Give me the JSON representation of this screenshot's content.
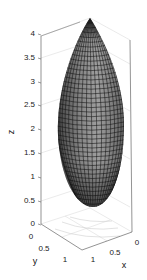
{
  "chart_data": {
    "type": "surface3d",
    "title": "",
    "xlabel": "x",
    "ylabel": "y",
    "zlabel": "z",
    "xlim": [
      0,
      1
    ],
    "ylim": [
      0,
      1
    ],
    "zlim": [
      0,
      4
    ],
    "x_ticks": [
      "0",
      "0.5",
      "1"
    ],
    "y_ticks": [
      "0",
      "0.5",
      "1"
    ],
    "z_ticks": [
      "0",
      "0.5",
      "1",
      "1.5",
      "2",
      "2.5",
      "3",
      "3.5",
      "4"
    ],
    "surface": {
      "apex_z": 4,
      "bottom_z": 0.5,
      "max_radius": 0.5,
      "center": [
        0.5,
        0.5
      ],
      "colormap": "gray",
      "mesh": true
    },
    "box": true,
    "grid": true
  },
  "axes": {
    "xlabel": "x",
    "ylabel": "y",
    "zlabel": "z",
    "x_ticks": [
      "0",
      "0.5",
      "1"
    ],
    "y_ticks": [
      "0",
      "0.5",
      "1"
    ],
    "z_ticks": [
      "0",
      "0.5",
      "1",
      "1.5",
      "2",
      "2.5",
      "3",
      "3.5",
      "4"
    ]
  },
  "colors": {
    "surface_light": "#9a9a9a",
    "surface_dark": "#3a3a3a",
    "mesh": "#111111",
    "box": "#555555",
    "grid": "#dddddd"
  }
}
